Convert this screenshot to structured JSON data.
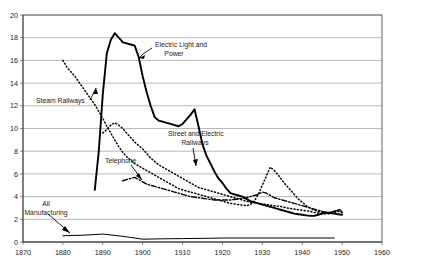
{
  "chart_data": {
    "type": "line",
    "title": "",
    "subtitle": "",
    "xlabel": "",
    "ylabel": "",
    "xlim": [
      1870,
      1960
    ],
    "ylim": [
      0,
      20
    ],
    "grid": true,
    "legend_position": "annotations-inline",
    "xticks": [
      "1870",
      "1880",
      "1890",
      "1900",
      "1910",
      "1920",
      "1930",
      "1940",
      "1950",
      "1960"
    ],
    "yticks": [
      "0",
      "2",
      "4",
      "6",
      "8",
      "10",
      "12",
      "14",
      "16",
      "18",
      "20"
    ],
    "annotations": [
      {
        "id": "electric-light-and-power",
        "text": "Electric Light and",
        "text2": "Power"
      },
      {
        "id": "steam-railways",
        "text": "Steam Railways",
        "text2": ""
      },
      {
        "id": "street-and-electric-railways",
        "text": "Street and Electric",
        "text2": "Railways"
      },
      {
        "id": "telephone",
        "text": "Telephone",
        "text2": ""
      },
      {
        "id": "all-manufacturing",
        "text": "All",
        "text2": "Manufacturing"
      }
    ],
    "series": [
      {
        "name": "Electric Light and Power",
        "style": "solid",
        "x": [
          1888,
          1889,
          1890,
          1891,
          1892,
          1893,
          1894,
          1895,
          1896,
          1897,
          1898,
          1899,
          1900,
          1901,
          1902,
          1903,
          1904,
          1905,
          1906,
          1907,
          1908,
          1909,
          1910,
          1911,
          1912,
          1913,
          1914,
          1915,
          1916,
          1917,
          1918,
          1919,
          1920,
          1921,
          1922,
          1923,
          1924,
          1925,
          1926,
          1927,
          1928,
          1929,
          1930,
          1931,
          1932,
          1933,
          1934,
          1935,
          1936,
          1937,
          1938,
          1939,
          1940,
          1941,
          1942,
          1943,
          1944,
          1945,
          1946,
          1947,
          1948,
          1949,
          1950
        ],
        "values": [
          4.6,
          8.0,
          13.0,
          16.6,
          17.8,
          18.4,
          18.0,
          17.6,
          17.5,
          17.4,
          17.3,
          16.3,
          14.6,
          13.2,
          12.0,
          11.0,
          10.7,
          10.6,
          10.5,
          10.4,
          10.3,
          10.2,
          10.4,
          10.8,
          11.2,
          11.7,
          10.2,
          8.6,
          7.6,
          6.9,
          6.2,
          5.6,
          5.2,
          4.7,
          4.3,
          4.2,
          4.1,
          4.0,
          3.8,
          3.6,
          3.5,
          3.4,
          3.3,
          3.2,
          3.1,
          3.0,
          2.9,
          2.8,
          2.7,
          2.6,
          2.5,
          2.45,
          2.4,
          2.35,
          2.3,
          2.3,
          2.4,
          2.5,
          2.6,
          2.55,
          2.5,
          2.45,
          2.4
        ]
      },
      {
        "name": "Steam Railways",
        "style": "dotted",
        "x": [
          1880,
          1881,
          1882,
          1883,
          1884,
          1885,
          1886,
          1887,
          1888,
          1889,
          1890,
          1891,
          1892,
          1893,
          1894,
          1895,
          1896,
          1897,
          1898,
          1899,
          1900,
          1901,
          1902,
          1903,
          1904,
          1905,
          1906,
          1907,
          1908,
          1909,
          1910,
          1911,
          1912,
          1913,
          1914,
          1915,
          1916,
          1917,
          1918,
          1919,
          1920,
          1921,
          1922,
          1923,
          1924,
          1925,
          1926,
          1927,
          1928,
          1929,
          1930,
          1931,
          1932,
          1933,
          1934,
          1935,
          1936,
          1937,
          1938,
          1939,
          1940,
          1941,
          1942,
          1943,
          1944,
          1945,
          1946,
          1947,
          1948,
          1949,
          1950
        ],
        "values": [
          16.0,
          15.4,
          15.0,
          14.6,
          14.1,
          13.6,
          13.1,
          12.6,
          12.1,
          11.5,
          10.9,
          10.2,
          9.6,
          9.0,
          8.4,
          7.9,
          7.5,
          7.2,
          6.9,
          6.7,
          6.5,
          6.3,
          6.1,
          5.9,
          5.7,
          5.5,
          5.3,
          5.1,
          4.9,
          4.7,
          4.6,
          4.5,
          4.4,
          4.3,
          4.2,
          4.1,
          4.0,
          3.9,
          3.8,
          3.7,
          3.6,
          3.5,
          3.4,
          3.35,
          3.3,
          3.25,
          3.2,
          3.3,
          3.6,
          4.2,
          5.0,
          5.8,
          6.6,
          6.3,
          5.9,
          5.4,
          5.0,
          4.6,
          4.2,
          3.8,
          3.5,
          3.2,
          3.0,
          2.8,
          2.7,
          2.6,
          2.5,
          2.5,
          2.6,
          2.7,
          2.6
        ]
      },
      {
        "name": "Street and Electric Railways",
        "style": "dotted",
        "x": [
          1890,
          1891,
          1892,
          1893,
          1894,
          1895,
          1896,
          1897,
          1898,
          1899,
          1900,
          1901,
          1902,
          1903,
          1904,
          1905,
          1906,
          1907,
          1908,
          1909,
          1910,
          1911,
          1912,
          1913,
          1914,
          1915,
          1916,
          1917,
          1918,
          1919,
          1920,
          1921,
          1922,
          1923,
          1924,
          1925,
          1926,
          1927,
          1928,
          1929,
          1930,
          1931,
          1932,
          1933,
          1934,
          1935,
          1936,
          1937,
          1938,
          1939,
          1940,
          1941,
          1942,
          1943,
          1944,
          1945,
          1946,
          1947,
          1948,
          1949,
          1950
        ],
        "values": [
          9.6,
          9.9,
          10.3,
          10.5,
          10.3,
          10.0,
          9.6,
          9.2,
          8.8,
          8.5,
          8.2,
          7.8,
          7.4,
          7.1,
          6.8,
          6.6,
          6.4,
          6.2,
          6.0,
          5.8,
          5.6,
          5.4,
          5.2,
          5.0,
          4.8,
          4.7,
          4.6,
          4.5,
          4.4,
          4.3,
          4.2,
          4.1,
          4.0,
          3.9,
          3.8,
          3.7,
          3.6,
          3.5,
          3.45,
          3.4,
          3.35,
          3.3,
          3.25,
          3.2,
          3.15,
          3.1,
          3.0,
          2.95,
          2.9,
          2.85,
          2.8,
          2.75,
          2.7,
          2.6,
          2.55,
          2.5,
          2.5,
          2.6,
          2.7,
          2.8,
          2.7
        ]
      },
      {
        "name": "Telephone",
        "style": "dashdot",
        "x": [
          1895,
          1896,
          1897,
          1898,
          1899,
          1900,
          1901,
          1902,
          1903,
          1904,
          1905,
          1906,
          1907,
          1908,
          1909,
          1910,
          1911,
          1912,
          1913,
          1914,
          1915,
          1916,
          1917,
          1918,
          1919,
          1920,
          1921,
          1922,
          1923,
          1924,
          1925,
          1926,
          1927,
          1928,
          1929,
          1930,
          1931,
          1932,
          1933,
          1934,
          1935,
          1936,
          1937,
          1938,
          1939,
          1940,
          1941,
          1942,
          1943,
          1944,
          1945,
          1946,
          1947,
          1948,
          1949,
          1950
        ],
        "values": [
          5.4,
          5.5,
          5.6,
          5.7,
          5.5,
          5.3,
          5.1,
          5.0,
          4.9,
          4.8,
          4.7,
          4.6,
          4.5,
          4.4,
          4.3,
          4.2,
          4.1,
          4.0,
          3.95,
          3.9,
          3.85,
          3.8,
          3.75,
          3.7,
          3.7,
          3.7,
          3.7,
          3.7,
          3.75,
          3.8,
          3.85,
          3.9,
          4.0,
          4.1,
          4.2,
          4.4,
          4.3,
          4.1,
          3.9,
          3.8,
          3.7,
          3.6,
          3.5,
          3.4,
          3.3,
          3.2,
          3.1,
          3.0,
          2.9,
          2.8,
          2.7,
          2.6,
          2.6,
          2.7,
          2.8,
          2.9
        ]
      },
      {
        "name": "All Manufacturing",
        "style": "solid-thin",
        "x": [
          1880,
          1885,
          1890,
          1895,
          1900,
          1905,
          1910,
          1915,
          1920,
          1925,
          1930,
          1935,
          1940,
          1945,
          1948
        ],
        "values": [
          0.55,
          0.6,
          0.7,
          0.5,
          0.25,
          0.28,
          0.3,
          0.32,
          0.35,
          0.35,
          0.35,
          0.35,
          0.35,
          0.35,
          0.35
        ]
      }
    ]
  }
}
